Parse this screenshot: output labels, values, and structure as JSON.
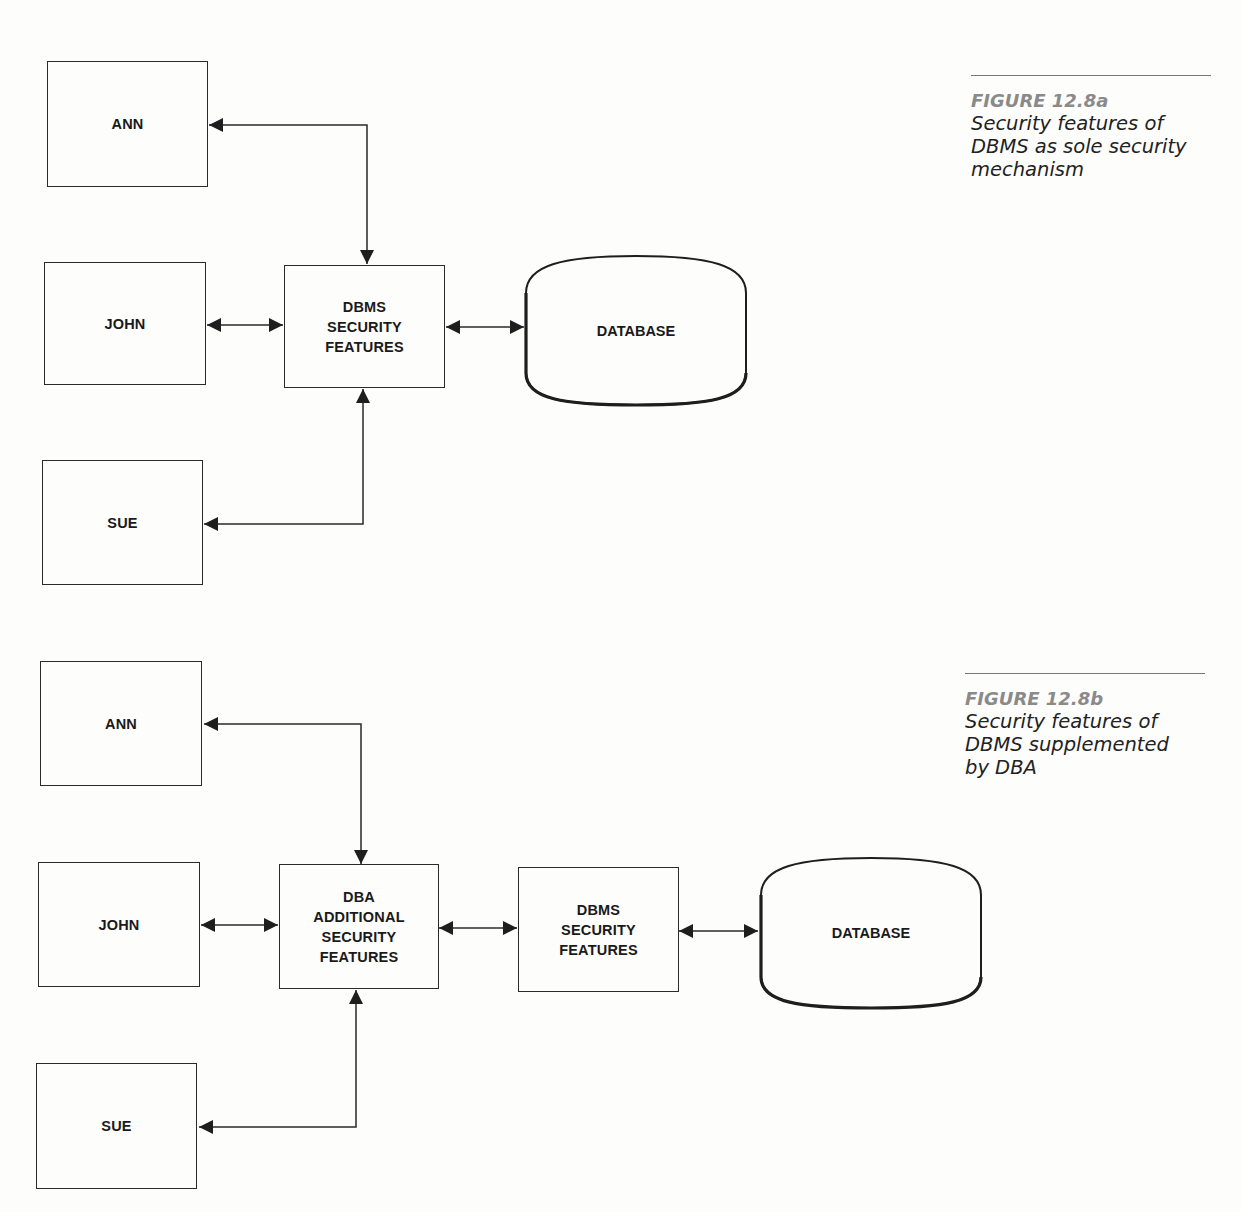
{
  "figure_a": {
    "caption": {
      "number": "FIGURE 12.8a",
      "lines": [
        "Security features of",
        "DBMS as sole security",
        "mechanism"
      ]
    },
    "nodes": {
      "ann": {
        "label": "ANN"
      },
      "john": {
        "label": "JOHN"
      },
      "sue": {
        "label": "SUE"
      },
      "dbms": {
        "lines": [
          "DBMS",
          "SECURITY",
          "FEATURES"
        ]
      },
      "database": {
        "label": "DATABASE"
      }
    },
    "edges": [
      {
        "from": "ANN",
        "to": "DBMS SECURITY FEATURES",
        "type": "bidirectional"
      },
      {
        "from": "JOHN",
        "to": "DBMS SECURITY FEATURES",
        "type": "bidirectional"
      },
      {
        "from": "SUE",
        "to": "DBMS SECURITY FEATURES",
        "type": "bidirectional"
      },
      {
        "from": "DBMS SECURITY FEATURES",
        "to": "DATABASE",
        "type": "bidirectional"
      }
    ]
  },
  "figure_b": {
    "caption": {
      "number": "FIGURE 12.8b",
      "lines": [
        "Security features of",
        "DBMS supplemented",
        "by DBA"
      ]
    },
    "nodes": {
      "ann": {
        "label": "ANN"
      },
      "john": {
        "label": "JOHN"
      },
      "sue": {
        "label": "SUE"
      },
      "dba": {
        "lines": [
          "DBA",
          "ADDITIONAL",
          "SECURITY",
          "FEATURES"
        ]
      },
      "dbms": {
        "lines": [
          "DBMS",
          "SECURITY",
          "FEATURES"
        ]
      },
      "database": {
        "label": "DATABASE"
      }
    },
    "edges": [
      {
        "from": "ANN",
        "to": "DBA ADDITIONAL SECURITY FEATURES",
        "type": "bidirectional"
      },
      {
        "from": "JOHN",
        "to": "DBA ADDITIONAL SECURITY FEATURES",
        "type": "bidirectional"
      },
      {
        "from": "SUE",
        "to": "DBA ADDITIONAL SECURITY FEATURES",
        "type": "bidirectional"
      },
      {
        "from": "DBA ADDITIONAL SECURITY FEATURES",
        "to": "DBMS SECURITY FEATURES",
        "type": "bidirectional"
      },
      {
        "from": "DBMS SECURITY FEATURES",
        "to": "DATABASE",
        "type": "bidirectional"
      }
    ]
  },
  "colors": {
    "line": "#2a2a2a",
    "caption_number": "#8a8a8a",
    "caption_text": "#222222",
    "background": "#fdfdfc"
  }
}
